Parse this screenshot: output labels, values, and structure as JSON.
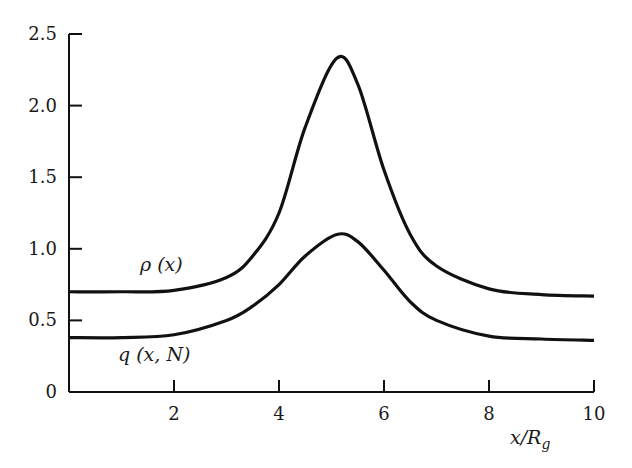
{
  "chart_data": {
    "type": "line",
    "title": "",
    "xlabel": "x/R_g",
    "ylabel": "",
    "xlim": [
      0,
      10
    ],
    "ylim": [
      0,
      2.5
    ],
    "grid": false,
    "legend": "inline labels",
    "x_ticks": [
      2,
      4,
      6,
      8,
      10
    ],
    "x_tick_labels": [
      "2",
      "4",
      "6",
      "8",
      "10"
    ],
    "y_ticks": [
      0,
      0.5,
      1.0,
      1.5,
      2.0,
      2.5
    ],
    "y_tick_labels": [
      "0",
      "0.5",
      "1.0",
      "1.5",
      "2.0",
      "2.5"
    ],
    "x": [
      0,
      1,
      2,
      3,
      3.5,
      4,
      4.5,
      5.1,
      5.5,
      6,
      6.5,
      7,
      8,
      9,
      10
    ],
    "series": [
      {
        "name": "ρ (x)",
        "values": [
          0.7,
          0.7,
          0.71,
          0.8,
          0.95,
          1.25,
          1.85,
          2.33,
          2.15,
          1.55,
          1.1,
          0.88,
          0.72,
          0.68,
          0.67
        ]
      },
      {
        "name": "q (x, N)",
        "values": [
          0.38,
          0.38,
          0.4,
          0.5,
          0.6,
          0.75,
          0.95,
          1.1,
          1.05,
          0.85,
          0.63,
          0.5,
          0.39,
          0.37,
          0.36
        ]
      }
    ],
    "annotations": [
      {
        "text": "ρ (x)",
        "x": 1.7,
        "y": 0.88
      },
      {
        "text": "q (x, N)",
        "x": 1.6,
        "y": 0.26
      }
    ]
  },
  "labels": {
    "x_axis_title": "x/R",
    "x_axis_sub": "g",
    "rho_label": "ρ (x)",
    "q_label": "q (x, N)"
  },
  "style": {
    "line_color": "#111111",
    "axis_color": "#111111"
  }
}
